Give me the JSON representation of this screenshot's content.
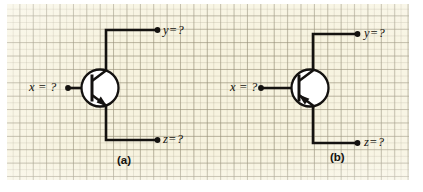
{
  "figure": {
    "kind": "bjt-transistor-exercise",
    "background_color": "#f7f3df",
    "grid_line_color": "#968f78",
    "ink_color": "#141210",
    "panels": [
      {
        "id": "a",
        "caption": "(a)",
        "device": "npn-bipolar-junction-transistor",
        "terminals": {
          "base_label": "x = ?",
          "collector_label": "y=?",
          "emitter_label": "z=?"
        }
      },
      {
        "id": "b",
        "caption": "(b)",
        "device": "pnp-bipolar-junction-transistor",
        "terminals": {
          "base_label": "x = ?",
          "collector_label": "y=?",
          "emitter_label": "z=?"
        }
      }
    ]
  }
}
